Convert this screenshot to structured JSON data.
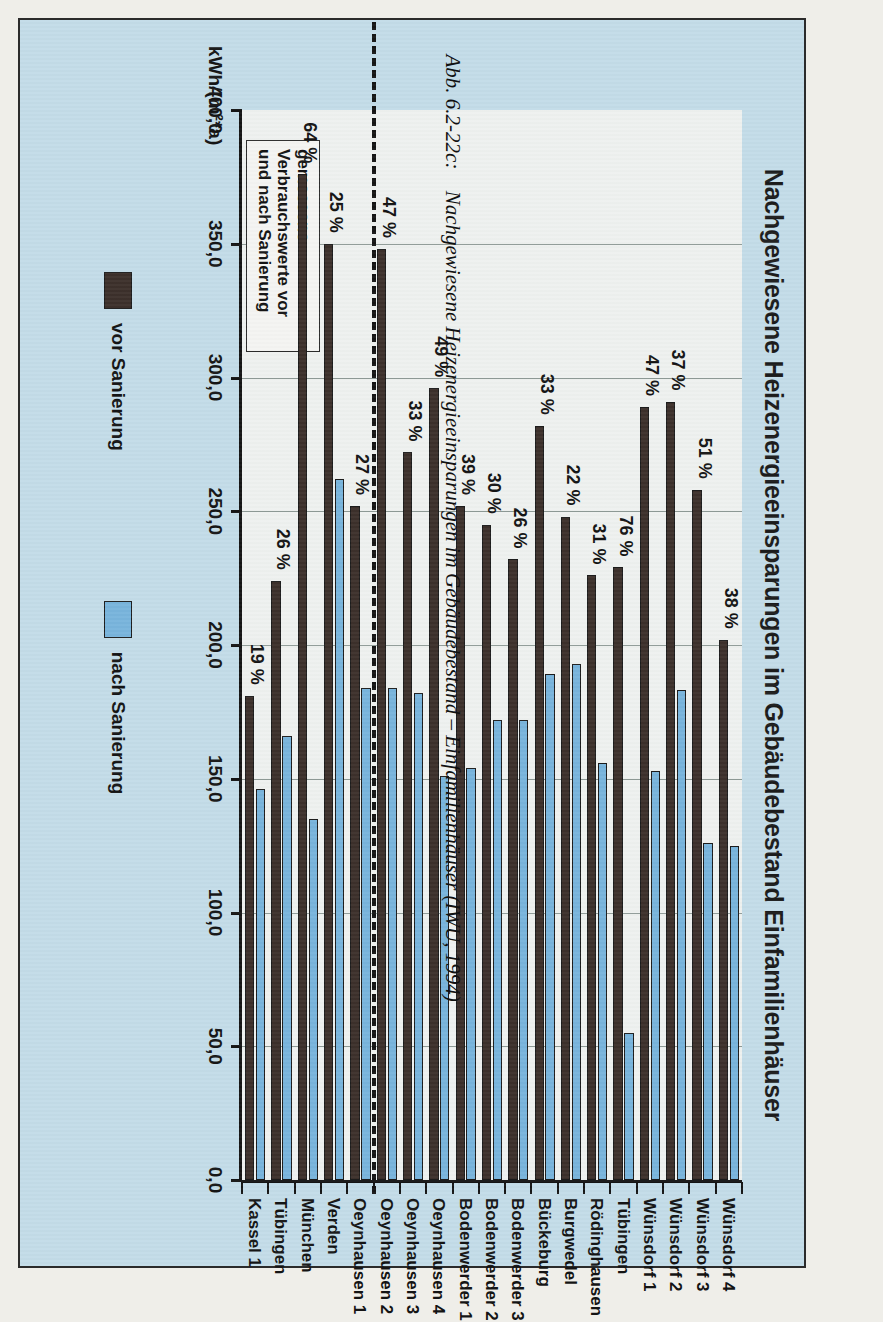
{
  "figure": {
    "caption_number": "Abb. 6.2-22c:",
    "caption_text": "Nachgewiesene Heizenergieeinsparungen im Gebäudebestand – Einfamilienhäuser (IWU, 1994)"
  },
  "note": {
    "line1": "gemessene",
    "line2": "Verbrauchswerte vor",
    "line3": "und nach Sanierung"
  },
  "legend": {
    "items": [
      {
        "label": "vor Sanierung",
        "color": "#3c302b"
      },
      {
        "label": "nach Sanierung",
        "color": "#78b4dc"
      }
    ]
  },
  "colors": {
    "background": "#c3dce8",
    "plot_background": "#eef1ef",
    "before": "#3c302b",
    "after": "#78b4dc",
    "axis": "#151515",
    "grid": "#8e9a96"
  },
  "chart_data": {
    "type": "bar",
    "orientation": "horizontal",
    "title": "Nachgewiesene Heizenergieeinsparungen im Gebäudebestand Einfamilienhäuser",
    "xlabel": "",
    "ylabel": "kWh/(m²*a)",
    "axis_unit": "kWh/(m²*a)",
    "ylim": [
      0,
      400
    ],
    "tick_labels": [
      "0,0",
      "50,0",
      "100,0",
      "150,0",
      "200,0",
      "250,0",
      "300,0",
      "350,0",
      "400,0"
    ],
    "tick_values": [
      0,
      50,
      100,
      150,
      200,
      250,
      300,
      350,
      400
    ],
    "grid": true,
    "legend_position": "bottom",
    "categories": [
      "Kassel 1",
      "Tübingen",
      "München",
      "Verden",
      "Oeynhausen 1",
      "Oeynhausen 2",
      "Oeynhausen 3",
      "Oeynhausen 4",
      "Bodenwerder 1",
      "Bodenwerder 2",
      "Bodenwerder 3",
      "Bückeburg",
      "Burgwedel",
      "Rödinghausen",
      "Tübingen",
      "Wünsdorf 1",
      "Wünsdorf 2",
      "Wünsdorf 3",
      "Wünsdorf 4"
    ],
    "series": [
      {
        "name": "vor Sanierung",
        "color": "#3c302b",
        "values": [
          181,
          224,
          376,
          350,
          252,
          348,
          272,
          296,
          252,
          245,
          232,
          282,
          248,
          226,
          229,
          289,
          291,
          258,
          202
        ]
      },
      {
        "name": "nach Sanierung",
        "color": "#78b4dc",
        "values": [
          146,
          166,
          135,
          262,
          184,
          184,
          182,
          151,
          154,
          172,
          172,
          189,
          193,
          156,
          55,
          153,
          183,
          126,
          125
        ]
      }
    ],
    "data_labels": {
      "series": "Einsparung",
      "unit": "%",
      "values": [
        "19 %",
        "26 %",
        "64 %",
        "25 %",
        "27 %",
        "47 %",
        "33 %",
        "49 %",
        "39 %",
        "30 %",
        "26 %",
        "33 %",
        "22 %",
        "31 %",
        "76 %",
        "47 %",
        "37 %",
        "51 %",
        "38 %"
      ]
    },
    "annotations": [
      {
        "type": "dashed-separator",
        "after_category": "Oeynhausen 1",
        "note": "trennt Referenzobjekte"
      },
      {
        "type": "textbox",
        "text": "gemessene Verbrauchswerte vor und nach Sanierung"
      }
    ]
  }
}
